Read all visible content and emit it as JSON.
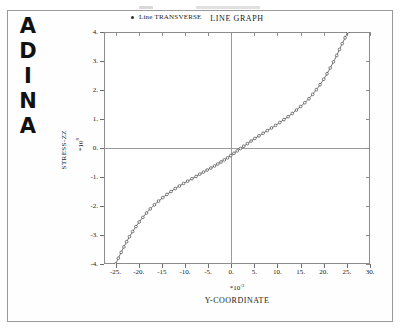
{
  "branding": {
    "logo_text": "ADINA",
    "logo_letters": [
      "A",
      "D",
      "I",
      "N",
      "A"
    ]
  },
  "graph": {
    "title": "LINE GRAPH"
  },
  "legend": {
    "marker": "filled-circle-marker",
    "label": "Line TRANSVERSE"
  },
  "axes": {
    "y": {
      "name": "STRESS-ZZ",
      "multiplier": "*10",
      "multiplier_exponent": "8",
      "ticks": [
        "4.",
        "3.",
        "2.",
        "1.",
        "0.",
        "-1.",
        "-2.",
        "-3.",
        "-4."
      ],
      "values": [
        4,
        3,
        2,
        1,
        0,
        -1,
        -2,
        -3,
        -4
      ]
    },
    "x": {
      "name": "Y-COORDINATE",
      "multiplier": "*10",
      "multiplier_exponent": "-3",
      "ticks": [
        "-25.",
        "-20.",
        "-15",
        "-10.",
        "-5.",
        "0.",
        "5.",
        "10.",
        "15.",
        "20.",
        "25.",
        "30."
      ],
      "values": [
        -25,
        -20,
        -15,
        -10,
        -5,
        0,
        5,
        10,
        15,
        20,
        25,
        30
      ]
    }
  },
  "colors": {
    "frame": "#8d8d8d",
    "page_border": "#9a9a9a",
    "curve": "#3a3a3a",
    "marker": "#2b2b2b",
    "text": "#1a1a1a"
  },
  "chart_data": {
    "type": "line",
    "title": "LINE GRAPH",
    "xlabel": "Y-COORDINATE",
    "ylabel": "STRESS-ZZ",
    "x_multiplier": 0.001,
    "y_multiplier": 100000000,
    "xlim": [
      -27.5,
      30
    ],
    "ylim": [
      -4,
      4
    ],
    "grid": false,
    "legend_position": "top-center",
    "series": [
      {
        "name": "Line TRANSVERSE",
        "marker": "circle",
        "x": [
          -25.0,
          -24.4,
          -23.8,
          -23.2,
          -22.6,
          -22.0,
          -21.3,
          -20.6,
          -19.9,
          -19.1,
          -18.3,
          -17.5,
          -16.6,
          -15.7,
          -14.8,
          -13.9,
          -13.0,
          -12.1,
          -11.2,
          -10.3,
          -9.4,
          -8.5,
          -7.6,
          -6.8,
          -6.0,
          -5.2,
          -4.4,
          -3.6,
          -2.9,
          -2.2,
          -1.5,
          -0.8,
          -0.1,
          0.6,
          1.3,
          2.0,
          2.7,
          3.5,
          4.3,
          5.1,
          6.0,
          6.9,
          7.8,
          8.7,
          9.6,
          10.5,
          11.4,
          12.3,
          13.2,
          14.1,
          15.0,
          15.9,
          16.8,
          17.6,
          18.4,
          19.2,
          20.0,
          20.7,
          21.4,
          22.1,
          22.8,
          23.4,
          24.0,
          24.6,
          25.2
        ],
        "y": [
          -4.0,
          -3.8,
          -3.6,
          -3.41,
          -3.23,
          -3.06,
          -2.88,
          -2.71,
          -2.55,
          -2.39,
          -2.24,
          -2.1,
          -1.96,
          -1.83,
          -1.71,
          -1.6,
          -1.5,
          -1.4,
          -1.31,
          -1.22,
          -1.14,
          -1.06,
          -0.98,
          -0.9,
          -0.83,
          -0.76,
          -0.69,
          -0.62,
          -0.55,
          -0.48,
          -0.41,
          -0.34,
          -0.26,
          -0.18,
          -0.1,
          -0.02,
          0.06,
          0.15,
          0.24,
          0.33,
          0.42,
          0.51,
          0.6,
          0.69,
          0.78,
          0.88,
          0.98,
          1.08,
          1.19,
          1.31,
          1.43,
          1.56,
          1.7,
          1.85,
          2.01,
          2.18,
          2.37,
          2.56,
          2.76,
          2.97,
          3.19,
          3.4,
          3.6,
          3.8,
          4.0
        ]
      }
    ]
  }
}
